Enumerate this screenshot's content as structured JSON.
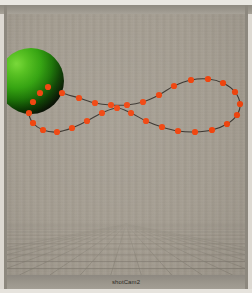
{
  "window": {
    "title": "shotCam2",
    "chrome_color": "#9b968c",
    "frame_light": "#e6e3dd"
  },
  "viewport": {
    "name": "perspective-viewport",
    "background_color": "#a49d91",
    "width": 238,
    "height": 261,
    "horizon_y": 210,
    "grid": {
      "name": "ground-plane-grid",
      "line_color": "#7d776c",
      "highlight_line_color": "#6b6659",
      "rows": 13,
      "columns": 17,
      "vanishing_point_x": 119,
      "vanishing_point_y": 209
    },
    "sphere": {
      "name": "green-sphere",
      "label": "sphere",
      "center_x": 24,
      "center_y": 67,
      "radius": 33,
      "highlight_color": "#5ec22a",
      "mid_color": "#2f9b12",
      "shadow_color": "#0b1504"
    },
    "motion_path": {
      "name": "figure-eight-motion-path",
      "curve_color": "#3b3630",
      "marker_color": "#f0450f",
      "marker_radius": 3.1,
      "crossing_x": 121,
      "crossing_y": 91,
      "keyframe_points": [
        [
          41,
          73
        ],
        [
          55,
          79
        ],
        [
          72,
          84
        ],
        [
          88,
          89
        ],
        [
          104,
          91
        ],
        [
          120,
          91
        ],
        [
          136,
          88
        ],
        [
          152,
          81
        ],
        [
          167,
          72
        ],
        [
          184,
          66
        ],
        [
          201,
          65
        ],
        [
          216,
          69
        ],
        [
          228,
          78
        ],
        [
          233,
          90
        ],
        [
          230,
          101
        ],
        [
          220,
          110
        ],
        [
          205,
          116
        ],
        [
          188,
          118
        ],
        [
          171,
          117
        ],
        [
          155,
          113
        ],
        [
          139,
          107
        ],
        [
          124,
          99
        ],
        [
          110,
          94
        ],
        [
          95,
          99
        ],
        [
          80,
          107
        ],
        [
          65,
          114
        ],
        [
          50,
          118
        ],
        [
          36,
          116
        ],
        [
          26,
          109
        ],
        [
          22,
          99
        ],
        [
          26,
          88
        ],
        [
          33,
          79
        ]
      ]
    }
  },
  "camera_bar": {
    "name": "camera-name-bar",
    "text": "shotCam2"
  }
}
